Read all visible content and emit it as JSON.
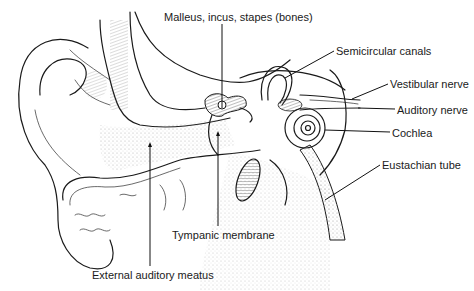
{
  "diagram": {
    "labels": [
      {
        "id": "ossicles",
        "text": "Malleus, incus, stapes (bones)",
        "x": 164,
        "y": 11
      },
      {
        "id": "semicircular",
        "text": "Semicircular canals",
        "x": 336,
        "y": 45
      },
      {
        "id": "vestibular",
        "text": "Vestibular nerve",
        "x": 390,
        "y": 78
      },
      {
        "id": "auditory",
        "text": "Auditory nerve",
        "x": 397,
        "y": 104
      },
      {
        "id": "cochlea",
        "text": "Cochlea",
        "x": 392,
        "y": 127
      },
      {
        "id": "eustachian",
        "text": "Eustachian tube",
        "x": 382,
        "y": 159
      },
      {
        "id": "tympanic",
        "text": "Tympanic membrane",
        "x": 172,
        "y": 229
      },
      {
        "id": "meatus",
        "text": "External auditory meatus",
        "x": 92,
        "y": 269
      }
    ],
    "colors": {
      "ink": "#1a1a1a",
      "background": "#ffffff",
      "stipple": "#9a9a9a"
    }
  }
}
